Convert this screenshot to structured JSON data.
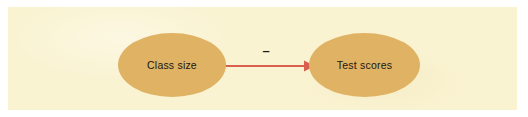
{
  "diagram": {
    "background_color": "#faf3d2",
    "node_fill_color": "#e0b264",
    "arrow_color": "#d9604f",
    "label_color": "#1c1712",
    "nodes": [
      {
        "id": "cause",
        "label": "Class size"
      },
      {
        "id": "effect",
        "label": "Test scores"
      }
    ],
    "edges": [
      {
        "id": "cause-to-effect",
        "from": "Class size",
        "to": "Test scores",
        "sign": "–",
        "direction": "right",
        "style": "solid-arrow"
      }
    ]
  }
}
